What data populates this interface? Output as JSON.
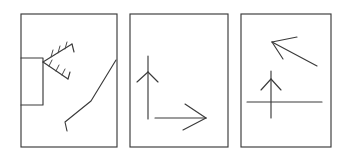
{
  "figure": {
    "background_color": "#ffffff",
    "ink_color": "#3a3a3a",
    "panel_count": 3,
    "width": 349,
    "height": 159
  },
  "panels": [
    {
      "id": "panel-1",
      "label": "Panel 1",
      "frame": {
        "x": 21,
        "y": 14,
        "width": 96,
        "height": 133
      },
      "shapes": [
        {
          "name": "open-rectangle",
          "type": "polyline",
          "description": "rectangle open at its left side, attached to panel left border",
          "points": "21,58 43,58 43,105 21,105"
        },
        {
          "name": "feathered-arrow-upper",
          "type": "polyline",
          "description": "upper feathered shaft radiating up-right from vertex",
          "points": "43,62 72,44"
        },
        {
          "name": "feathered-arrow-upper-tip",
          "type": "polyline",
          "description": "hook at end of upper feathered shaft",
          "points": "72,44 74,52"
        },
        {
          "name": "feather-tick-upper-1",
          "type": "polyline",
          "points": "51,57 53,50"
        },
        {
          "name": "feather-tick-upper-2",
          "type": "polyline",
          "points": "58,53 60,46"
        },
        {
          "name": "feather-tick-upper-3",
          "type": "polyline",
          "points": "65,49 67,42"
        },
        {
          "name": "feathered-arrow-lower",
          "type": "polyline",
          "description": "lower feathered shaft radiating down-right from vertex",
          "points": "43,62 68,79"
        },
        {
          "name": "feathered-arrow-lower-tip",
          "type": "polyline",
          "points": "68,79 70,72"
        },
        {
          "name": "feather-tick-lower-1",
          "type": "polyline",
          "points": "49,66 52,60"
        },
        {
          "name": "feather-tick-lower-2",
          "type": "polyline",
          "points": "56,71 59,65"
        },
        {
          "name": "feather-tick-lower-3",
          "type": "polyline",
          "points": "62,75 65,69"
        },
        {
          "name": "bent-polyline",
          "type": "polyline",
          "description": "long bent line from upper right down to lower left with a hook",
          "points": "116,60 91,101 65,122 67,131"
        }
      ]
    },
    {
      "id": "panel-2",
      "label": "Panel 2",
      "frame": {
        "x": 130,
        "y": 14,
        "width": 98,
        "height": 133
      },
      "shapes": [
        {
          "name": "up-arrow-shaft",
          "type": "polyline",
          "description": "vertical arrow shaft pointing up",
          "points": "148,56 148,119"
        },
        {
          "name": "up-arrow-barb-left",
          "type": "polyline",
          "points": "148,72 137,82"
        },
        {
          "name": "up-arrow-barb-right",
          "type": "polyline",
          "points": "148,72 158,82"
        },
        {
          "name": "right-arrow-shaft",
          "type": "polyline",
          "description": "horizontal arrow shaft pointing right",
          "points": "155,118 206,118"
        },
        {
          "name": "right-arrow-barb-upper",
          "type": "polyline",
          "points": "206,118 185,104"
        },
        {
          "name": "right-arrow-barb-lower",
          "type": "polyline",
          "points": "206,118 183,130"
        }
      ]
    },
    {
      "id": "panel-3",
      "label": "Panel 3",
      "frame": {
        "x": 241,
        "y": 14,
        "width": 90,
        "height": 133
      },
      "shapes": [
        {
          "name": "diagonal-arrow-shaft",
          "type": "polyline",
          "description": "diagonal arrow shaft pointing up-left",
          "points": "317,66 272,42"
        },
        {
          "name": "diagonal-arrow-barb-upper",
          "type": "polyline",
          "points": "272,42 297,37"
        },
        {
          "name": "diagonal-arrow-barb-lower",
          "type": "polyline",
          "points": "272,42 283,59"
        },
        {
          "name": "up-arrow-shaft",
          "type": "polyline",
          "description": "vertical arrow shaft pointing up",
          "points": "271,71 271,118"
        },
        {
          "name": "up-arrow-barb-left",
          "type": "polyline",
          "points": "271,79 261,90"
        },
        {
          "name": "up-arrow-barb-right",
          "type": "polyline",
          "points": "271,79 281,90"
        },
        {
          "name": "horizontal-line",
          "type": "polyline",
          "description": "horizontal line crossing the up-arrow shaft",
          "points": "247,102 322,102"
        }
      ]
    }
  ]
}
